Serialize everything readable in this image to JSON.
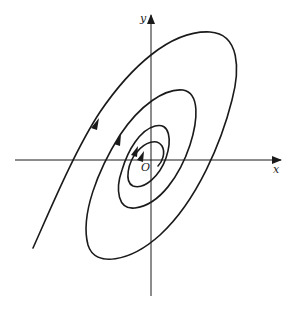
{
  "figure": {
    "type": "phase-portrait",
    "axes": {
      "x_label": "x",
      "y_label": "y",
      "origin_label": "O"
    },
    "colors": {
      "stroke": "#1a1a1a",
      "background": "#ffffff"
    },
    "arrows": {
      "count": 4,
      "direction": "along trajectory, up-right"
    }
  }
}
